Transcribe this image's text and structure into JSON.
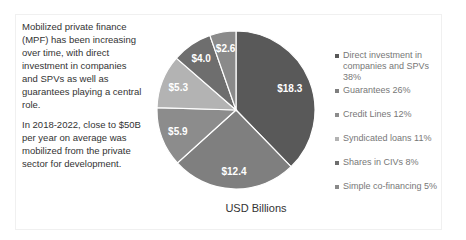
{
  "description": {
    "paragraphs": [
      "Mobilized private finance (MPF) has been increasing over time, with direct investment in companies and SPVs as well as guarantees playing a central role.",
      "In 2018-2022, close to $50B per year on average was mobilized from the private sector for development."
    ]
  },
  "chart_data": {
    "type": "pie",
    "title": "",
    "caption": "USD Billions",
    "categories": [
      "Direct investment in companies and SPVs",
      "Guarantees",
      "Credit Lines",
      "Syndicated loans",
      "Shares in CIVs",
      "Simple co-financing"
    ],
    "values": [
      18.3,
      12.4,
      5.9,
      5.3,
      4.0,
      2.6
    ],
    "value_labels": [
      "$18.3",
      "$12.4",
      "$5.9",
      "$5.3",
      "$4.0",
      "$2.6"
    ],
    "percentages": [
      38,
      26,
      12,
      11,
      8,
      5
    ],
    "legend_entries": [
      "Direct investment in companies and SPVs 38%",
      "Guarantees 26%",
      "Credit Lines 12%",
      "Syndicated loans 11%",
      "Shares in CIVs 8%",
      "Simple co-financing 5%"
    ],
    "colors": [
      "#595959",
      "#7f7f7f",
      "#8c8c8c",
      "#b3b3b3",
      "#6e6e6e",
      "#8a8a8a"
    ],
    "legend_position": "right",
    "start_angle_deg": 0,
    "direction": "clockwise"
  }
}
